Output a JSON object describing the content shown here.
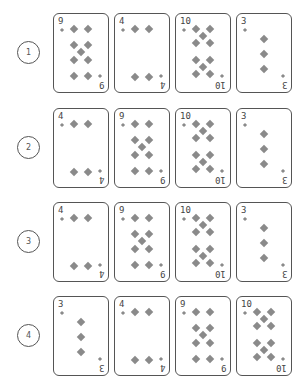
{
  "suit": "diamonds",
  "suit_icon": "diamond-icon",
  "colors": {
    "pip": "#8a8a8a",
    "border": "#555555",
    "text": "#444444"
  },
  "rows": [
    {
      "label": "1",
      "cards": [
        {
          "rank": "9"
        },
        {
          "rank": "4"
        },
        {
          "rank": "10"
        },
        {
          "rank": "3"
        }
      ]
    },
    {
      "label": "2",
      "cards": [
        {
          "rank": "4"
        },
        {
          "rank": "9"
        },
        {
          "rank": "10"
        },
        {
          "rank": "3"
        }
      ]
    },
    {
      "label": "3",
      "cards": [
        {
          "rank": "4"
        },
        {
          "rank": "9"
        },
        {
          "rank": "10"
        },
        {
          "rank": "3"
        }
      ]
    },
    {
      "label": "4",
      "cards": [
        {
          "rank": "3"
        },
        {
          "rank": "4"
        },
        {
          "rank": "9"
        },
        {
          "rank": "10"
        }
      ]
    }
  ]
}
